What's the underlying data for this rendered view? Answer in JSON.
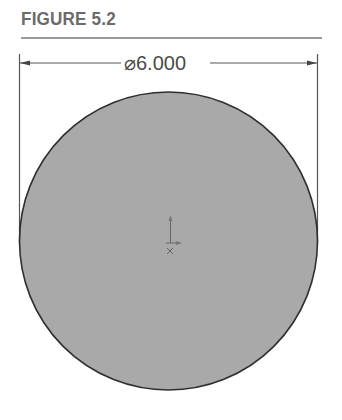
{
  "figure": {
    "title": "FIGURE 5.2"
  },
  "drawing": {
    "dimension": {
      "symbol": "⌀",
      "value": "6.000",
      "label": "⌀6.000",
      "type": "diameter"
    },
    "shape": "circle",
    "fill_color": "#a9a9a9",
    "outline_color": "#2f2f2f",
    "origin_marker": "origin-axes-icon"
  }
}
